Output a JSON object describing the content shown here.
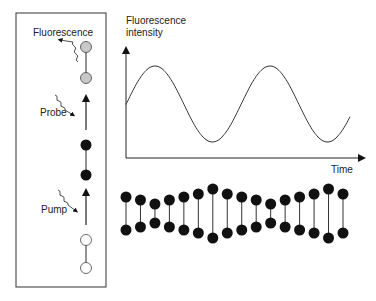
{
  "left_panel": {
    "labels": {
      "fluorescence": "Fluorescence",
      "probe": "Probe",
      "pump": "Pump"
    },
    "states": [
      {
        "name": "excited-probe-upper",
        "fill": "#c8c8c8"
      },
      {
        "name": "excited-probe-lower",
        "fill": "#c8c8c8"
      },
      {
        "name": "pumped-upper",
        "fill": "#111111"
      },
      {
        "name": "pumped-lower",
        "fill": "#111111"
      },
      {
        "name": "ground-upper",
        "fill": "#ffffff"
      },
      {
        "name": "ground-lower",
        "fill": "#ffffff"
      }
    ]
  },
  "chart": {
    "ylabel_line1": "Fluorescence",
    "ylabel_line2": "intensity",
    "xlabel": "Time"
  },
  "chart_data": {
    "type": "line",
    "title": "",
    "xlabel": "Time",
    "ylabel": "Fluorescence intensity",
    "grid": false,
    "x": [
      0,
      0.125,
      0.25,
      0.5,
      0.75,
      1.0,
      1.25,
      1.5,
      1.75,
      2.0,
      2.25
    ],
    "values": [
      0.5,
      0.85,
      1.0,
      0.5,
      0.0,
      0.5,
      1.0,
      0.5,
      0.0,
      0.3,
      0.65
    ]
  },
  "molecule_chain": {
    "count": 16,
    "top_y": [
      197,
      200,
      204,
      200,
      197,
      194,
      189,
      194,
      197,
      200,
      204,
      200,
      197,
      194,
      189,
      194
    ],
    "bottom_y": [
      230,
      227,
      223,
      227,
      230,
      233,
      238,
      233,
      230,
      227,
      223,
      227,
      230,
      233,
      238,
      233
    ]
  }
}
